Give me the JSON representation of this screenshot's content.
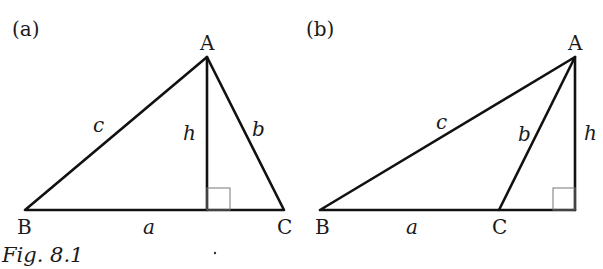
{
  "figure": {
    "caption": "Fig. 8.1",
    "panels": [
      {
        "id": "a",
        "label": "(a)",
        "vertices": {
          "A": "A",
          "B": "B",
          "C": "C"
        },
        "sides": {
          "a": "a",
          "b": "b",
          "c": "c",
          "h": "h"
        },
        "description": "Acute triangle ABC with altitude h from A falling inside base BC"
      },
      {
        "id": "b",
        "label": "(b)",
        "vertices": {
          "A": "A",
          "B": "B",
          "C": "C"
        },
        "sides": {
          "a": "a",
          "b": "b",
          "c": "c",
          "h": "h"
        },
        "description": "Obtuse triangle ABC with altitude h from A falling outside base BC (extended)"
      }
    ]
  },
  "colors": {
    "line": "#111111",
    "right_angle_box": "#777777",
    "background": "#ffffff"
  }
}
